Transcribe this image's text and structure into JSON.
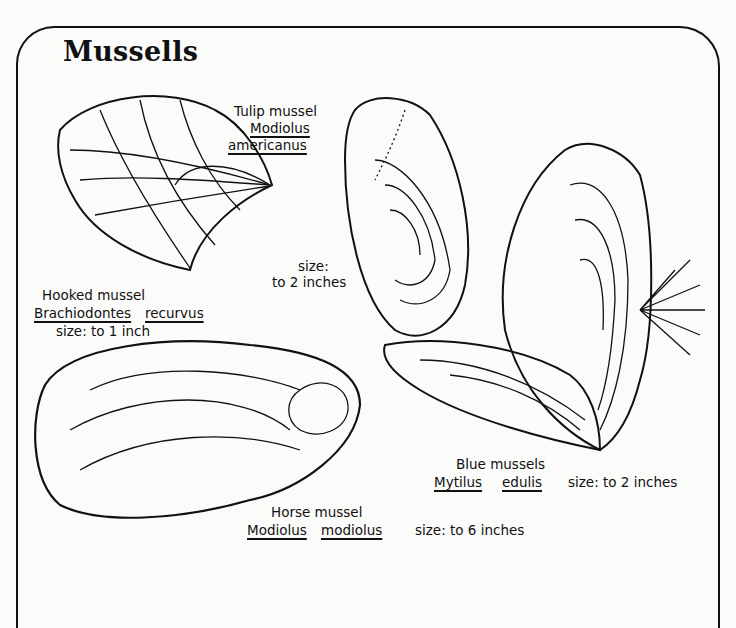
{
  "title": "Mussells",
  "species": [
    {
      "id": "tulip",
      "common_name": "Tulip mussel",
      "genus": "Modiolus",
      "species": "americanus",
      "size_label": "size:",
      "size_value": "to 2 inches"
    },
    {
      "id": "hooked",
      "common_name": "Hooked mussel",
      "genus": "Brachiodontes",
      "species": "recurvus",
      "size": "size: to 1 inch"
    },
    {
      "id": "blue",
      "common_name": "Blue mussels",
      "genus": "Mytilus",
      "species": "edulis",
      "size": "size: to 2 inches"
    },
    {
      "id": "horse",
      "common_name": "Horse mussel",
      "genus": "Modiolus",
      "species": "modiolus",
      "size": "size: to 6 inches"
    }
  ],
  "colors": {
    "ink": "#111111",
    "paper": "#fbfbfa"
  }
}
